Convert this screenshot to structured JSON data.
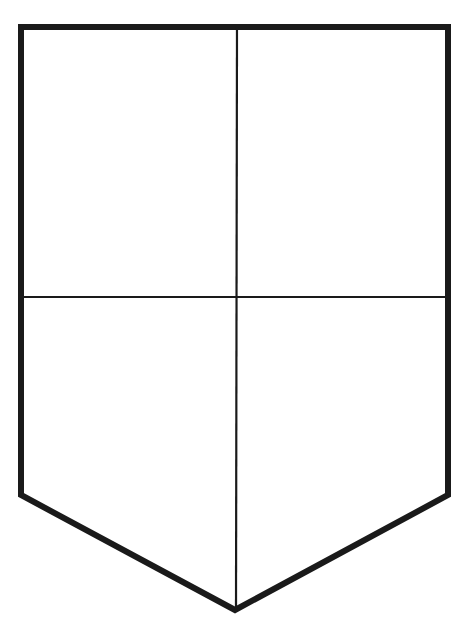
{
  "figure": {
    "type": "shield-outline",
    "stroke_color": "#1a1a1a",
    "background": "#ffffff",
    "outline_width": 6,
    "divider_width": 2.2,
    "outline_points": [
      [
        21,
        27
      ],
      [
        448,
        27
      ],
      [
        448,
        495
      ],
      [
        235,
        610
      ],
      [
        21,
        495
      ]
    ],
    "vertical_divider": {
      "x": 237,
      "y1": 27,
      "y2": 610
    },
    "horizontal_divider": {
      "y": 297,
      "x1": 21,
      "x2": 448
    },
    "quarters": [
      "top-left",
      "top-right",
      "bottom-left",
      "bottom-right"
    ]
  }
}
